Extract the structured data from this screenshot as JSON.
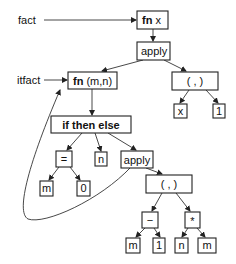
{
  "labels": {
    "fact": "fact",
    "itfact": "itfact"
  },
  "nodes": {
    "fn_x": {
      "kw": "fn",
      "arg": " x"
    },
    "apply_top": {
      "text": "apply"
    },
    "fn_mn": {
      "kw": "fn",
      "arg": " (m,n)"
    },
    "pair_top": {
      "text": "( , )"
    },
    "x_leaf": {
      "text": "x"
    },
    "one_leaf_top": {
      "text": "1"
    },
    "ite": {
      "text": "if then else"
    },
    "eq": {
      "text": "="
    },
    "n_leaf": {
      "text": "n"
    },
    "apply_inner": {
      "text": "apply"
    },
    "m_leaf_eq": {
      "text": "m"
    },
    "zero_leaf": {
      "text": "0"
    },
    "pair_inner": {
      "text": "( , )"
    },
    "minus": {
      "text": "−"
    },
    "times": {
      "text": "*"
    },
    "m_leaf_minus": {
      "text": "m"
    },
    "one_leaf_minus": {
      "text": "1"
    },
    "n_leaf_times": {
      "text": "n"
    },
    "m_leaf_times": {
      "text": "m"
    }
  },
  "colors": {
    "stroke": "#222222",
    "background": "#ffffff"
  }
}
